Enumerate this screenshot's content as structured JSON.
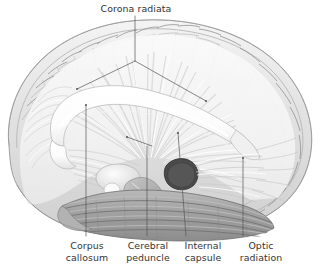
{
  "figure": {
    "style": "grayscale anatomical illustration",
    "background_color": "#ffffff",
    "ink_color": "#333333",
    "leader_color": "#555555"
  },
  "labels": {
    "corona_radiata": "Corona radiata",
    "corpus_callosum": "Corpus\ncallosum",
    "cerebral_peduncle": "Cerebral\npeduncle",
    "internal_capsule": "Internal\ncapsule",
    "optic_radiation": "Optic\nradiation"
  },
  "label_positions": {
    "corona_radiata": {
      "x": 98,
      "y": 3,
      "width": 76,
      "align": "center"
    },
    "corpus_callosum": {
      "x": 60,
      "y": 240,
      "width": 54,
      "align": "center"
    },
    "cerebral_peduncle": {
      "x": 120,
      "y": 240,
      "width": 56,
      "align": "center"
    },
    "internal_capsule": {
      "x": 178,
      "y": 240,
      "width": 50,
      "align": "center"
    },
    "optic_radiation": {
      "x": 232,
      "y": 240,
      "width": 58,
      "align": "center"
    }
  },
  "leader_lines": {
    "corona_radiata_stem": "M135,16 L135,61",
    "corona_radiata_left_arm": "M135,61 L77,89",
    "corona_radiata_right_arm": "M135,61 L206,101",
    "corpus_callosum": "M86,105 L86,236",
    "cerebral_peduncle_tick": "M127,137 L152,146",
    "cerebral_peduncle": "M147,146 L147,236",
    "internal_capsule": "M178,133 L186,236",
    "optic_radiation": "M243,158 L243,236"
  },
  "anatomy": {
    "structures": [
      "cerebral cortex with gyri and sulci",
      "corona radiata fiber fan",
      "corpus callosum",
      "internal capsule",
      "cerebral peduncle",
      "optic radiation",
      "temporal lobe",
      "brainstem",
      "thalamus"
    ]
  }
}
